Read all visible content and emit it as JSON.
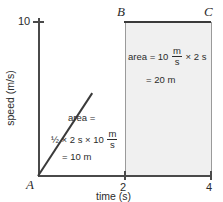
{
  "chart_data": {
    "type": "line",
    "title": "",
    "xlabel": "time (s)",
    "ylabel": "speed (m/s)",
    "xlim": [
      0,
      4
    ],
    "ylim": [
      0,
      10
    ],
    "grid": false,
    "legend": "none",
    "x": [
      0,
      2,
      4
    ],
    "values": [
      0,
      10,
      10
    ],
    "series": [
      {
        "name": "speed",
        "x": [
          0,
          2,
          4
        ],
        "values": [
          0,
          10,
          10
        ]
      }
    ],
    "xticks": [
      "2",
      "4"
    ],
    "xtick_values": [
      2,
      4
    ],
    "yticks": [
      "10"
    ],
    "ytick_values": [
      10
    ],
    "point_labels": [
      {
        "label": "A",
        "x": 0,
        "y": 0
      },
      {
        "label": "B",
        "x": 2,
        "y": 10
      },
      {
        "label": "C",
        "x": 4,
        "y": 10
      }
    ],
    "annotations": [
      {
        "name": "rectangle-area",
        "region": "B-C rectangle",
        "line1_prefix": "area = 10 ",
        "line1_frac_num": "m",
        "line1_frac_den": "s",
        "line1_suffix": " × 2 s",
        "line2": "= 20 m",
        "result_value": 20,
        "result_unit": "m"
      },
      {
        "name": "triangle-area",
        "region": "A-B triangle",
        "line1": "area =",
        "line2_prefix": "½ × 2 s × 10 ",
        "line2_frac_num": "m",
        "line2_frac_den": "s",
        "line3": "= 10 m",
        "result_value": 10,
        "result_unit": "m"
      }
    ],
    "shaded_region": {
      "name": "rectangle-shading",
      "x_range": [
        2,
        4
      ],
      "y_range": [
        0,
        10
      ],
      "color": "#f0f0f0"
    },
    "colors": {
      "axis": "#4a4a4a",
      "line": "#3a3a3a",
      "shade": "#f0f0f0",
      "text": "#2b2b2b"
    }
  }
}
